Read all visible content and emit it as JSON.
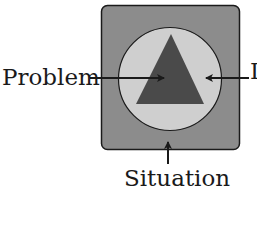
{
  "diagram": {
    "labels": {
      "problem": "Problem",
      "i": "I",
      "situation": "Situation"
    },
    "colors": {
      "outer_square": "#8c8c8c",
      "circle": "#cfcfcf",
      "triangle": "#4a4a4a",
      "stroke": "#1a1a1a"
    },
    "shapes": [
      {
        "name": "Situation",
        "shape": "rounded-square"
      },
      {
        "name": "I",
        "shape": "circle"
      },
      {
        "name": "Problem",
        "shape": "triangle"
      }
    ]
  }
}
